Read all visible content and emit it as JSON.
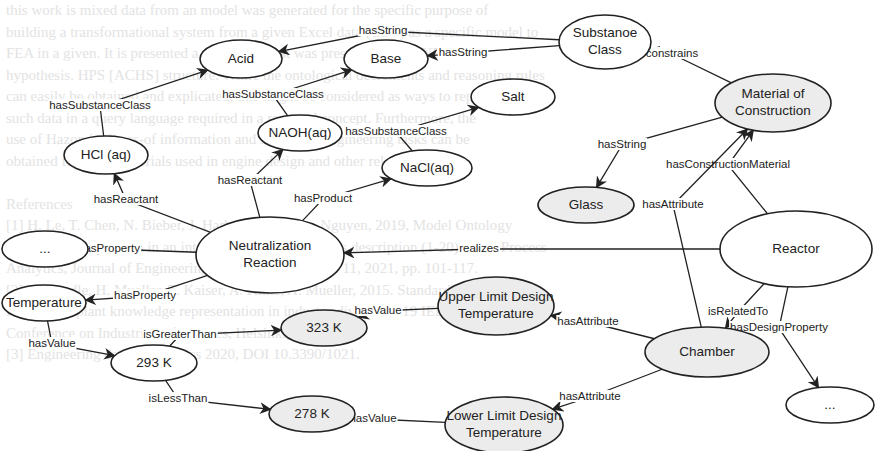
{
  "background_text": {
    "lines": [
      "this work is mixed data from an model was generated for the specific purpose of",
      "building a transformational system from a given Excel data (CSV) as a specific model to",
      "FEA in a given. It is presented a separation that was presented in P.J. NEA in a",
      "hypothesis. HPS [ACHS] structure. While the ontological decrements and reasoning rules",
      "can easily be obtained and explicated, this might be considered as ways to represent",
      "such data in a query language required in a reported concept. Furthermore, the",
      "use of Hazop in the as-of information and in a set of engineering tasks can be",
      "obtained from the materials used in engine design and other related phases.",
      "",
      "References",
      "[1] H. Le, T. Chen, N. Bieber, J. Harb, Y. Lu, L. Lo, Nguyen, 2019, Model Ontology",
      "and its implementation in an integrated chemical process description (1-20), Plant Process",
      "Analytics, Journal of Engineering and Data Informatics 11, 2021, pp. 101-117.",
      "[2] A. Kendle, H. Mueller, T. Kaiser, A. Kline, A. Mueller, 2015. Standardised Ontology",
      "for process plant knowledge representation in industry diverse, 2019 IEEE International",
      "Conference on Industrial Informatics, Helsinki, FI, 2019.",
      "[3] Engineering data informatics 2020, DOI 10.3390/1021."
    ]
  },
  "diagram": {
    "nodes": {
      "substance_class": {
        "label_lines": [
          "Substanoe",
          "Class"
        ],
        "cx": 605,
        "cy": 42,
        "rx": 46,
        "ry": 27,
        "fill": "plain"
      },
      "acid": {
        "label_lines": [
          "Acid"
        ],
        "cx": 241,
        "cy": 59,
        "rx": 41,
        "ry": 19,
        "fill": "plain"
      },
      "base": {
        "label_lines": [
          "Base"
        ],
        "cx": 386,
        "cy": 59,
        "rx": 42,
        "ry": 19,
        "fill": "plain"
      },
      "salt": {
        "label_lines": [
          "Salt"
        ],
        "cx": 513,
        "cy": 97,
        "rx": 42,
        "ry": 18,
        "fill": "plain"
      },
      "material": {
        "label_lines": [
          "Material of",
          "Construction"
        ],
        "cx": 773,
        "cy": 103,
        "rx": 58,
        "ry": 29,
        "fill": "shaded"
      },
      "hcl": {
        "label_lines": [
          "HCl (aq)"
        ],
        "cx": 106,
        "cy": 155,
        "rx": 42,
        "ry": 19,
        "fill": "plain"
      },
      "naoh": {
        "label_lines": [
          "NAOH(aq)"
        ],
        "cx": 300,
        "cy": 133,
        "rx": 42,
        "ry": 18,
        "fill": "plain"
      },
      "nacl": {
        "label_lines": [
          "NaCl(aq)"
        ],
        "cx": 427,
        "cy": 168,
        "rx": 45,
        "ry": 18,
        "fill": "plain"
      },
      "glass": {
        "label_lines": [
          "Glass"
        ],
        "cx": 586,
        "cy": 205,
        "rx": 48,
        "ry": 18,
        "fill": "shaded"
      },
      "ellipsis_left": {
        "label_lines": [
          "..."
        ],
        "cx": 45,
        "cy": 249,
        "rx": 43,
        "ry": 18,
        "fill": "plain"
      },
      "neutralization": {
        "label_lines": [
          "Neutralization",
          "Reaction"
        ],
        "cx": 270,
        "cy": 255,
        "rx": 74,
        "ry": 38,
        "fill": "plain"
      },
      "reactor": {
        "label_lines": [
          "Reactor"
        ],
        "cx": 796,
        "cy": 249,
        "rx": 76,
        "ry": 38,
        "fill": "plain"
      },
      "temperature": {
        "label_lines": [
          "Temperature"
        ],
        "cx": 44,
        "cy": 303,
        "rx": 42,
        "ry": 18,
        "fill": "plain"
      },
      "upper_limit": {
        "label_lines": [
          "Upper Limit Design",
          "Temperature"
        ],
        "cx": 496,
        "cy": 306,
        "rx": 58,
        "ry": 29,
        "fill": "shaded"
      },
      "k323": {
        "label_lines": [
          "323 K"
        ],
        "cx": 324,
        "cy": 328,
        "rx": 43,
        "ry": 18,
        "fill": "shaded"
      },
      "k293": {
        "label_lines": [
          "293 K"
        ],
        "cx": 154,
        "cy": 363,
        "rx": 43,
        "ry": 18,
        "fill": "plain"
      },
      "chamber": {
        "label_lines": [
          "Chamber"
        ],
        "cx": 707,
        "cy": 352,
        "rx": 62,
        "ry": 25,
        "fill": "shaded"
      },
      "ellipsis_right": {
        "label_lines": [
          "..."
        ],
        "cx": 830,
        "cy": 405,
        "rx": 44,
        "ry": 18,
        "fill": "plain"
      },
      "k278": {
        "label_lines": [
          "278 K"
        ],
        "cx": 312,
        "cy": 414,
        "rx": 43,
        "ry": 18,
        "fill": "shaded"
      },
      "lower_limit": {
        "label_lines": [
          "Lower Limit Design",
          "Temperature"
        ],
        "cx": 504,
        "cy": 425,
        "rx": 59,
        "ry": 28,
        "fill": "shaded"
      }
    },
    "edges": [
      {
        "id": "acid_hasstring",
        "label": "hasString",
        "from": "substance_class",
        "to": "acid",
        "label_x": 383,
        "label_y": 31
      },
      {
        "id": "base_hasstring",
        "label": "hasString",
        "from": "substance_class",
        "to": "base",
        "label_x": 463,
        "label_y": 53
      },
      {
        "id": "mat_constrains",
        "label": "constrains",
        "from": "material",
        "to": "substance_class",
        "label_x": 672,
        "label_y": 54
      },
      {
        "id": "hcl_acid",
        "label": "hasSubstanceClass",
        "from": "hcl",
        "to": "acid",
        "label_x": 100,
        "label_y": 106
      },
      {
        "id": "naoh_base",
        "label": "hasSubstanceClass",
        "from": "naoh",
        "to": "base",
        "label_x": 273,
        "label_y": 95
      },
      {
        "id": "nacl_salt",
        "label": "hasSubstanceClass",
        "from": "nacl",
        "to": "salt",
        "label_x": 396,
        "label_y": 132
      },
      {
        "id": "mat_glass",
        "label": "hasString",
        "from": "material",
        "to": "glass",
        "label_x": 622,
        "label_y": 145
      },
      {
        "id": "nr_hcl",
        "label": "hasReactant",
        "from": "neutralization",
        "to": "hcl",
        "label_x": 126,
        "label_y": 200
      },
      {
        "id": "nr_naoh",
        "label": "hasReactant",
        "from": "neutralization",
        "to": "naoh",
        "label_x": 250,
        "label_y": 181
      },
      {
        "id": "nr_nacl",
        "label": "hasProduct",
        "from": "neutralization",
        "to": "nacl",
        "label_x": 323,
        "label_y": 199
      },
      {
        "id": "nr_ellipsis",
        "label": "hasProperty",
        "from": "neutralization",
        "to": "ellipsis_left",
        "label_x": 109,
        "label_y": 249
      },
      {
        "id": "reactor_realizes",
        "label": "realizes",
        "from": "reactor",
        "to": "neutralization",
        "label_x": 479,
        "label_y": 249
      },
      {
        "id": "reactor_material",
        "label": "hasConstructionMaterial",
        "from": "reactor",
        "to": "material",
        "label_x": 728,
        "label_y": 165
      },
      {
        "id": "chamber_material",
        "label": "hasAttribute",
        "from": "chamber",
        "to": "material",
        "label_x": 673,
        "label_y": 205
      },
      {
        "id": "nr_temperature",
        "label": "hasProperty",
        "from": "neutralization",
        "to": "temperature",
        "label_x": 145,
        "label_y": 296
      },
      {
        "id": "temp_293",
        "label": "hasValue",
        "from": "temperature",
        "to": "k293",
        "label_x": 52,
        "label_y": 344
      },
      {
        "id": "293_323",
        "label": "isGreaterThan",
        "from": "k293",
        "to": "k323",
        "label_x": 180,
        "label_y": 335
      },
      {
        "id": "293_278",
        "label": "isLessThan",
        "from": "k293",
        "to": "k278",
        "label_x": 178,
        "label_y": 399
      },
      {
        "id": "upper_323",
        "label": "hasValue",
        "from": "upper_limit",
        "to": "k323",
        "label_x": 378,
        "label_y": 311
      },
      {
        "id": "lower_278",
        "label": "hasValue",
        "from": "lower_limit",
        "to": "k278",
        "label_x": 373,
        "label_y": 419
      },
      {
        "id": "chamber_upper",
        "label": "hasAttribute",
        "from": "chamber",
        "to": "upper_limit",
        "label_x": 588,
        "label_y": 322
      },
      {
        "id": "chamber_lower",
        "label": "hasAttribute",
        "from": "chamber",
        "to": "lower_limit",
        "label_x": 590,
        "label_y": 397
      },
      {
        "id": "reactor_chamber",
        "label": "isRelatedTo",
        "from": "reactor",
        "to": "chamber",
        "label_x": 738,
        "label_y": 312
      },
      {
        "id": "reactor_design",
        "label": "hasDesignProperty",
        "from": "reactor",
        "to": "ellipsis_right",
        "label_x": 779,
        "label_y": 328
      }
    ]
  }
}
